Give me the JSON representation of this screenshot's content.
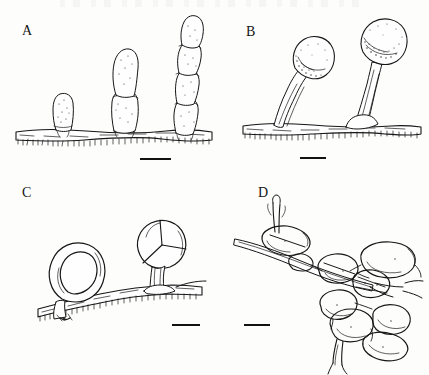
{
  "figure": {
    "kind": "scientific-line-drawing-plate",
    "background_color": "#fdfdfc",
    "ink_color": "#161616",
    "panel_count": 4
  },
  "panels": [
    {
      "id": "A",
      "letter": "A",
      "letter_x": 22,
      "letter_y": 24,
      "description": "Erect conidiophores bearing chains of elongate multicellular conidia arising from a horizontal hypha",
      "structures": [
        {
          "name": "conidial-chain-short",
          "cells": 1,
          "x": 60,
          "height": 36
        },
        {
          "name": "conidial-chain-medium",
          "cells": 2,
          "x": 130,
          "height": 76
        },
        {
          "name": "conidial-chain-tall",
          "cells": 4,
          "x": 192,
          "height": 112
        }
      ],
      "substrate_hypha": true,
      "scale_bar": {
        "x": 140,
        "y": 158,
        "width": 31
      }
    },
    {
      "id": "B",
      "letter": "B",
      "letter_x": 246,
      "letter_y": 25,
      "description": "Two globose single-celled conidia borne on tapering erect stalks from a hypha",
      "structures": [
        {
          "name": "globose-conidium-left",
          "cx": 301,
          "cy": 51,
          "r": 21
        },
        {
          "name": "globose-conidium-right",
          "cx": 359,
          "cy": 38,
          "r": 23
        }
      ],
      "substrate_hypha": true,
      "scale_bar": {
        "x": 300,
        "y": 157,
        "width": 26
      }
    },
    {
      "id": "C",
      "letter": "C",
      "letter_x": 22,
      "letter_y": 186,
      "description": "Trapping organs: a stalked double-walled constricting ring at left and a three-celled ring seen face-on at right, both on a creeping hypha",
      "structures": [
        {
          "name": "constricting-ring-side-view",
          "cx": 75,
          "cy": 262,
          "r": 27
        },
        {
          "name": "three-celled-ring-face-view",
          "cx": 162,
          "cy": 252,
          "r": 22,
          "cells": 3
        }
      ],
      "substrate_hypha": true,
      "scale_bar": {
        "x": 172,
        "y": 324,
        "width": 28
      }
    },
    {
      "id": "D",
      "letter": "D",
      "letter_x": 258,
      "letter_y": 186,
      "description": "Complex three-dimensional adhesive network of anastomosing hyphal loops",
      "structures": [
        {
          "name": "hyphal-loop-network",
          "loops": 9
        }
      ],
      "substrate_hypha": true,
      "scale_bar": {
        "x": 244,
        "y": 324,
        "width": 26
      }
    }
  ]
}
